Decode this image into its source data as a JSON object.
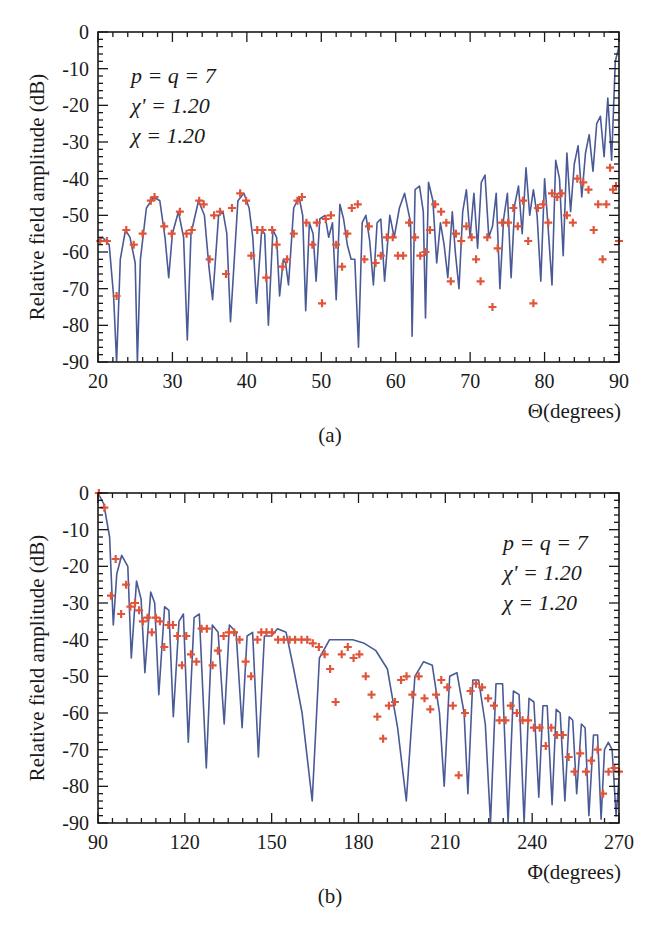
{
  "figure": {
    "panels": [
      {
        "id": "a",
        "caption": "(a)"
      },
      {
        "id": "b",
        "caption": "(b)"
      }
    ]
  },
  "colors": {
    "curve": "#4a5a96",
    "markers": "#e0553a",
    "axes": "#1a1a1a"
  },
  "chart_data": [
    {
      "type": "line",
      "panel": "(a)",
      "title": "",
      "xlabel": "Θ(degrees)",
      "ylabel": "Relative field amplitude (dB)",
      "xlim": [
        20,
        90
      ],
      "ylim": [
        -90,
        0
      ],
      "xticks": [
        20,
        30,
        40,
        50,
        60,
        70,
        80,
        90
      ],
      "yticks": [
        0,
        -10,
        -20,
        -30,
        -40,
        -50,
        -60,
        -70,
        -80,
        -90
      ],
      "grid": false,
      "annotation": [
        "p = q = 7",
        "χ' = 1.20",
        "χ = 1.20"
      ],
      "annotation_position": "top-left",
      "series": [
        {
          "name": "computed pattern (solid line)",
          "style": "line",
          "x": [
            20,
            20.6,
            21.5,
            22.1,
            22.5,
            23.0,
            23.7,
            24.3,
            25.0,
            25.3,
            25.7,
            26.5,
            27.5,
            28.3,
            29.0,
            29.5,
            30.0,
            30.8,
            31.5,
            32.0,
            32.5,
            33.5,
            34.3,
            34.9,
            35.4,
            36.2,
            36.8,
            37.3,
            37.8,
            38.8,
            39.6,
            40.3,
            40.8,
            41.3,
            42.0,
            42.4,
            42.9,
            43.5,
            44.0,
            44.4,
            44.9,
            45.2,
            45.6,
            46.3,
            47.0,
            47.5,
            47.9,
            48.4,
            48.9,
            49.3,
            49.8,
            50.5,
            51.0,
            51.5,
            52.0,
            52.5,
            53.0,
            53.5,
            54.0,
            54.5,
            55.0,
            55.5,
            56.0,
            56.5,
            57.0,
            57.5,
            58.0,
            58.5,
            59.2,
            59.8,
            60.5,
            61.2,
            62.0,
            62.2,
            62.6,
            63.2,
            63.7,
            64.0,
            64.4,
            65.0,
            65.5,
            66.0,
            66.5,
            67.0,
            67.6,
            68.0,
            68.5,
            69.0,
            69.5,
            70.0,
            70.5,
            71.0,
            71.5,
            72.0,
            72.5,
            73.0,
            73.5,
            74.0,
            74.5,
            75.0,
            75.5,
            76.0,
            76.5,
            77.0,
            77.5,
            78.0,
            78.5,
            79.0,
            79.5,
            80.0,
            80.5,
            81.0,
            81.5,
            82.0,
            82.5,
            83.0,
            83.5,
            84.0,
            84.5,
            85.0,
            85.5,
            86.0,
            86.5,
            87.0,
            87.5,
            88.0,
            88.5,
            89.0,
            89.5,
            90.0
          ],
          "y": [
            -57,
            -56,
            -58,
            -72,
            -90,
            -62,
            -54,
            -56,
            -63,
            -90,
            -62,
            -48,
            -45,
            -46,
            -56,
            -67,
            -55,
            -49,
            -56,
            -84,
            -55,
            -46,
            -50,
            -64,
            -73,
            -50,
            -49,
            -55,
            -79,
            -46,
            -44,
            -48,
            -56,
            -74,
            -54,
            -55,
            -80,
            -54,
            -56,
            -72,
            -62,
            -63,
            -69,
            -48,
            -45,
            -50,
            -76,
            -52,
            -55,
            -68,
            -51,
            -50,
            -56,
            -52,
            -73,
            -47,
            -51,
            -58,
            -62,
            -62,
            -86,
            -52,
            -50,
            -57,
            -69,
            -52,
            -51,
            -68,
            -50,
            -56,
            -48,
            -44,
            -52,
            -83,
            -43,
            -42,
            -49,
            -78,
            -41,
            -46,
            -63,
            -52,
            -58,
            -67,
            -49,
            -60,
            -70,
            -49,
            -43,
            -56,
            -44,
            -59,
            -41,
            -39,
            -56,
            -53,
            -44,
            -70,
            -51,
            -44,
            -67,
            -47,
            -42,
            -55,
            -37,
            -50,
            -43,
            -50,
            -68,
            -40,
            -54,
            -69,
            -35,
            -40,
            -61,
            -33,
            -49,
            -36,
            -31,
            -45,
            -33,
            -28,
            -38,
            -25,
            -23,
            -34,
            -18,
            -35,
            -8,
            -4,
            0
          ]
        },
        {
          "name": "measured/reference points (+ markers)",
          "style": "marker",
          "x": [
            20.3,
            21.2,
            22.5,
            23.8,
            24.8,
            26.0,
            27.1,
            27.6,
            28.9,
            29.9,
            31.0,
            31.9,
            32.6,
            33.6,
            34.2,
            35.0,
            35.6,
            36.4,
            37.2,
            38.0,
            39.1,
            39.9,
            40.6,
            41.4,
            42.1,
            42.6,
            43.4,
            44.0,
            44.8,
            45.4,
            46.3,
            46.8,
            47.4,
            48.0,
            48.8,
            49.4,
            50.1,
            50.6,
            51.3,
            52.0,
            52.8,
            53.5,
            54.1,
            54.9,
            55.8,
            56.4,
            57.3,
            58.0,
            58.8,
            59.6,
            60.3,
            61.0,
            61.8,
            62.6,
            63.3,
            64.0,
            64.6,
            65.3,
            66.1,
            66.8,
            67.4,
            68.1,
            68.8,
            69.5,
            70.2,
            70.8,
            71.4,
            72.3,
            73.0,
            73.7,
            74.3,
            75.1,
            75.8,
            76.4,
            77.1,
            77.8,
            78.5,
            79.1,
            79.8,
            80.5,
            81.0,
            81.7,
            82.3,
            83.0,
            83.8,
            84.4,
            85.2,
            85.9,
            86.6,
            87.2,
            87.8,
            88.3,
            88.8,
            89.2,
            89.6,
            90.0
          ],
          "y": [
            -57,
            -57,
            -72,
            -54,
            -58,
            -55,
            -46,
            -45,
            -53,
            -55,
            -49,
            -55,
            -54,
            -46,
            -47,
            -62,
            -50,
            -49,
            -66,
            -48,
            -44,
            -46,
            -61,
            -54,
            -54,
            -67,
            -54,
            -58,
            -64,
            -62,
            -55,
            -46,
            -45,
            -52,
            -58,
            -52,
            -74,
            -51,
            -50,
            -58,
            -64,
            -55,
            -48,
            -47,
            -62,
            -53,
            -63,
            -61,
            -56,
            -56,
            -61,
            -61,
            -52,
            -56,
            -61,
            -60,
            -54,
            -47,
            -49,
            -52,
            -68,
            -55,
            -57,
            -53,
            -56,
            -62,
            -68,
            -56,
            -75,
            -59,
            -52,
            -52,
            -48,
            -53,
            -46,
            -57,
            -74,
            -48,
            -47,
            -52,
            -44,
            -45,
            -44,
            -50,
            -52,
            -40,
            -41,
            -43,
            -54,
            -47,
            -62,
            -47,
            -37,
            -43,
            -42,
            -57
          ]
        }
      ]
    },
    {
      "type": "line",
      "panel": "(b)",
      "title": "",
      "xlabel": "Φ(degrees)",
      "ylabel": "Relative field amplitude (dB)",
      "xlim": [
        90,
        270
      ],
      "ylim": [
        -90,
        0
      ],
      "xticks": [
        90,
        120,
        150,
        180,
        210,
        240,
        270
      ],
      "yticks": [
        0,
        -10,
        -20,
        -30,
        -40,
        -50,
        -60,
        -70,
        -80,
        -90
      ],
      "grid": false,
      "annotation": [
        "p = q = 7",
        "χ' = 1.20",
        "χ = 1.20"
      ],
      "annotation_position": "top-right",
      "series": [
        {
          "name": "computed pattern (solid line)",
          "style": "line",
          "x": [
            90,
            92,
            94,
            95.3,
            96.5,
            98.2,
            100.3,
            101.5,
            103.3,
            104.9,
            106.2,
            108.2,
            109.6,
            111.0,
            113.0,
            114.5,
            116.0,
            118.0,
            119.5,
            121.2,
            123.2,
            125.0,
            127.4,
            129.5,
            131.5,
            133.6,
            135.4,
            137.7,
            139.8,
            141.5,
            143.4,
            145.4,
            147.5,
            149.9,
            152.0,
            155.0,
            157.6,
            160.5,
            164.0,
            166.5,
            170.0,
            174.0,
            178.0,
            182.0,
            186.0,
            190.0,
            193.5,
            196.5,
            199.5,
            202.5,
            205.5,
            208.0,
            209.6,
            211.5,
            214.0,
            216.5,
            217.8,
            219.5,
            221.5,
            223.8,
            225.6,
            227.5,
            229.8,
            231.7,
            233.5,
            235.5,
            237.2,
            238.9,
            240.6,
            242.3,
            243.7,
            245.2,
            246.9,
            248.3,
            249.7,
            251.3,
            252.8,
            254.0,
            255.4,
            257.0,
            258.3,
            259.6,
            261.2,
            262.6,
            263.8,
            265.0,
            266.3,
            267.6,
            269.0,
            270.0
          ],
          "y": [
            0,
            -3,
            -12,
            -36,
            -22,
            -17,
            -20,
            -45,
            -24,
            -29,
            -49,
            -27,
            -30,
            -55,
            -31,
            -32,
            -61,
            -35,
            -33,
            -68,
            -34,
            -33,
            -75,
            -36,
            -38,
            -63,
            -36,
            -38,
            -64,
            -39,
            -38,
            -72,
            -39,
            -39,
            -37,
            -38,
            -48,
            -60,
            -84,
            -45,
            -40,
            -40,
            -40,
            -41,
            -43,
            -48,
            -64,
            -84,
            -50,
            -46,
            -47,
            -60,
            -80,
            -50,
            -49,
            -60,
            -82,
            -51,
            -51,
            -63,
            -90,
            -52,
            -52,
            -90,
            -54,
            -55,
            -90,
            -56,
            -57,
            -83,
            -58,
            -58,
            -85,
            -59,
            -60,
            -84,
            -61,
            -62,
            -82,
            -63,
            -64,
            -88,
            -66,
            -66,
            -89,
            -70,
            -68,
            -70,
            -88,
            -78
          ],
          "note": "approximate trace; lobes and deep nulls"
        },
        {
          "name": "measured/reference points (+ markers)",
          "style": "marker",
          "x": [
            90.3,
            92.2,
            94.5,
            96.1,
            98.0,
            99.7,
            101.2,
            102.8,
            104.2,
            105.5,
            107.1,
            108.6,
            110.0,
            111.4,
            112.9,
            114.3,
            115.9,
            117.4,
            119.0,
            120.5,
            122.1,
            124.0,
            125.8,
            127.6,
            129.6,
            131.4,
            133.4,
            135.2,
            137.0,
            138.9,
            141.0,
            142.9,
            145.1,
            146.4,
            148.2,
            150.1,
            152.2,
            154.2,
            156.2,
            158.1,
            160.3,
            162.3,
            164.2,
            166.3,
            168.3,
            170.2,
            172.1,
            174.2,
            176.3,
            178.3,
            180.3,
            182.5,
            184.5,
            186.5,
            188.5,
            190.5,
            192.6,
            194.7,
            196.6,
            198.6,
            200.8,
            202.8,
            204.8,
            206.8,
            208.6,
            210.7,
            212.6,
            214.6,
            216.8,
            218.7,
            220.6,
            222.7,
            224.8,
            226.8,
            228.7,
            230.8,
            232.6,
            234.7,
            236.7,
            238.6,
            240.6,
            242.6,
            244.7,
            246.6,
            248.6,
            250.6,
            252.6,
            254.6,
            256.6,
            258.6,
            260.4,
            262.6,
            264.5,
            266.4,
            268.4,
            270.0
          ],
          "y": [
            0,
            -4,
            -28,
            -18,
            -33,
            -25,
            -31,
            -30,
            -32,
            -35,
            -34,
            -38,
            -34,
            -35,
            -42,
            -36,
            -36,
            -39,
            -47,
            -39,
            -44,
            -46,
            -37,
            -37,
            -47,
            -43,
            -39,
            -38,
            -38,
            -40,
            -46,
            -50,
            -40,
            -38,
            -38,
            -38,
            -40,
            -40,
            -40,
            -40,
            -40,
            -40,
            -41,
            -42,
            -44,
            -48,
            -57,
            -44,
            -42,
            -45,
            -44,
            -50,
            -55,
            -61,
            -67,
            -58,
            -57,
            -51,
            -50,
            -55,
            -50,
            -56,
            -59,
            -55,
            -51,
            -53,
            -58,
            -77,
            -60,
            -54,
            -52,
            -53,
            -56,
            -58,
            -62,
            -62,
            -58,
            -60,
            -62,
            -62,
            -64,
            -64,
            -69,
            -64,
            -66,
            -66,
            -72,
            -76,
            -71,
            -76,
            -73,
            -70,
            -82,
            -76,
            -75,
            -76
          ]
        }
      ]
    }
  ]
}
